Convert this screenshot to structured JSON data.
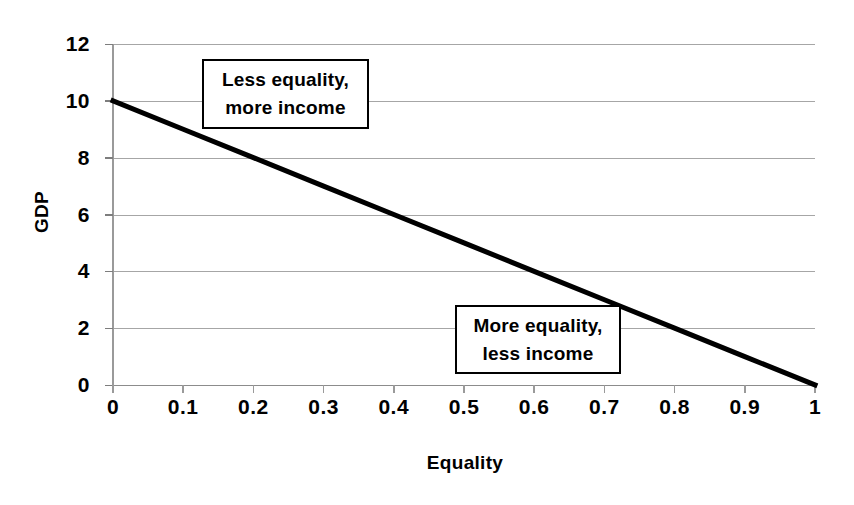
{
  "chart_data": {
    "type": "line",
    "title": "",
    "xlabel": "Equality",
    "ylabel": "GDP",
    "xlim": [
      0,
      1
    ],
    "ylim": [
      0,
      12
    ],
    "grid": true,
    "legend": "none",
    "x_ticks": [
      "0",
      "0.1",
      "0.2",
      "0.3",
      "0.4",
      "0.5",
      "0.6",
      "0.7",
      "0.8",
      "0.9",
      "1"
    ],
    "x_tick_values": [
      0,
      0.1,
      0.2,
      0.3,
      0.4,
      0.5,
      0.6,
      0.7,
      0.8,
      0.9,
      1
    ],
    "y_ticks": [
      "0",
      "2",
      "4",
      "6",
      "8",
      "10",
      "12"
    ],
    "y_tick_values": [
      0,
      2,
      4,
      6,
      8,
      10,
      12
    ],
    "series": [
      {
        "name": "GDP vs Equality tradeoff",
        "x": [
          0,
          0.1,
          0.2,
          0.3,
          0.4,
          0.5,
          0.6,
          0.7,
          0.8,
          0.9,
          1
        ],
        "values": [
          10,
          9,
          8,
          7,
          6,
          5,
          4,
          3,
          2,
          1,
          0
        ],
        "color": "#000000",
        "line_width": 5
      }
    ],
    "annotations": [
      {
        "id": "less-equality",
        "lines": [
          "Less equality,",
          "more income"
        ],
        "x_range": [
          0.13,
          0.365
        ],
        "y_range": [
          9.0,
          11.45
        ]
      },
      {
        "id": "more-equality",
        "lines": [
          "More equality,",
          "less income"
        ],
        "x_range": [
          0.487,
          0.723
        ],
        "y_range": [
          0.39,
          2.81
        ]
      }
    ]
  },
  "axes": {
    "y_title": "GDP",
    "x_title": "Equality"
  },
  "colors": {
    "line": "#000000",
    "gridline": "#a6a6a6",
    "axis": "#9a9a9a",
    "text": "#000000",
    "background": "#ffffff"
  }
}
